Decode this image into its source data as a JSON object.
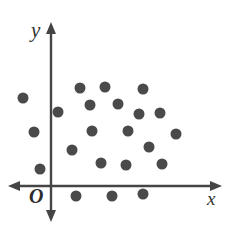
{
  "figure": {
    "title": "",
    "background_color": "#ffffff",
    "width": 235,
    "height": 229
  },
  "axes": {
    "x_label": "x",
    "y_label": "y",
    "origin_label": "O",
    "axis_color": "#454545",
    "origin_px": {
      "x": 51,
      "y": 186
    },
    "x_axis": {
      "start_px": 8,
      "end_px": 222,
      "y_px": 186,
      "arrow_both_ends": true
    },
    "y_axis": {
      "top_px": 22,
      "bottom_px": 222,
      "x_px": 51,
      "arrow_both_ends": true
    }
  },
  "chart_data": {
    "type": "scatter",
    "title": "",
    "xlabel": "x",
    "ylabel": "y",
    "grid": false,
    "legend": null,
    "marker": {
      "shape": "circle",
      "color": "#4a4a4a",
      "radius_px": 5.5,
      "count": 22
    },
    "axis_note": "Unscaled schematic axes with arrowheads on both ends; no tick marks or tick labels are drawn. Point positions are given in pixel coordinates of the image as well as in data units relative to the origin O (1 data unit = 1 pixel, y increasing upward).",
    "xlim_px": [
      8,
      222
    ],
    "ylim_px": [
      22,
      222
    ],
    "points_px": [
      {
        "x": 23,
        "y": 98
      },
      {
        "x": 34,
        "y": 132
      },
      {
        "x": 40,
        "y": 169
      },
      {
        "x": 58,
        "y": 112
      },
      {
        "x": 80,
        "y": 88
      },
      {
        "x": 105,
        "y": 87
      },
      {
        "x": 143,
        "y": 89
      },
      {
        "x": 90,
        "y": 105
      },
      {
        "x": 118,
        "y": 104
      },
      {
        "x": 139,
        "y": 114
      },
      {
        "x": 160,
        "y": 113
      },
      {
        "x": 92,
        "y": 131
      },
      {
        "x": 128,
        "y": 131
      },
      {
        "x": 176,
        "y": 134
      },
      {
        "x": 72,
        "y": 150
      },
      {
        "x": 149,
        "y": 147
      },
      {
        "x": 101,
        "y": 163
      },
      {
        "x": 126,
        "y": 165
      },
      {
        "x": 162,
        "y": 164
      },
      {
        "x": 76,
        "y": 196
      },
      {
        "x": 112,
        "y": 196
      },
      {
        "x": 143,
        "y": 194
      }
    ],
    "x": [
      -28,
      -17,
      -11,
      7,
      29,
      54,
      92,
      39,
      67,
      88,
      109,
      41,
      77,
      125,
      21,
      98,
      50,
      75,
      111,
      25,
      61,
      92
    ],
    "y": [
      88,
      54,
      17,
      74,
      98,
      99,
      97,
      81,
      82,
      72,
      73,
      55,
      55,
      52,
      36,
      39,
      23,
      21,
      22,
      -10,
      -10,
      -8
    ],
    "quadrant_counts": {
      "quadrant_I_positive_x_positive_y": 16,
      "quadrant_II_negative_x_positive_y": 3,
      "quadrant_III_negative_x_negative_y": 0,
      "quadrant_IV_positive_x_negative_y": 3
    }
  }
}
